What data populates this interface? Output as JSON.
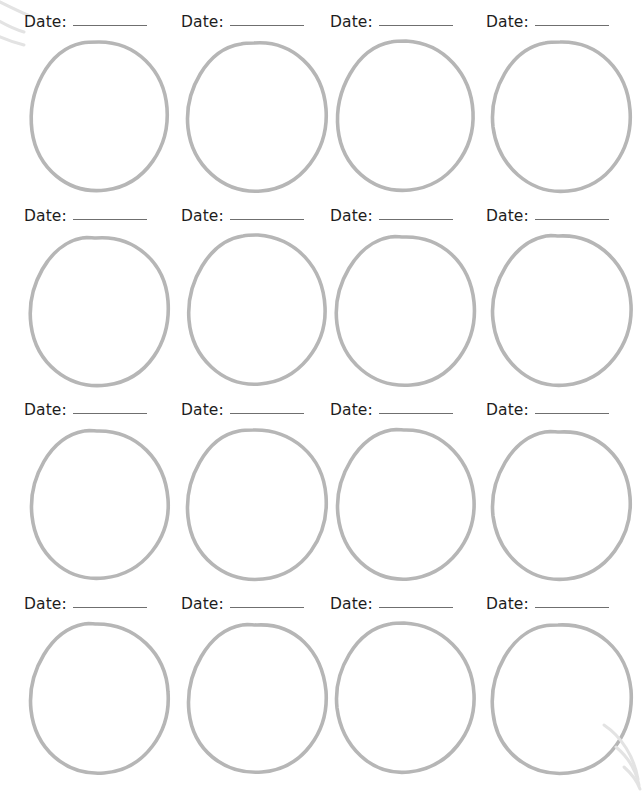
{
  "page": {
    "background_color": "#ffffff",
    "width": 640,
    "height": 789,
    "columns": 4,
    "rows": 4,
    "cell_count": 16
  },
  "style": {
    "label_text_color": "#1d1d1d",
    "rule_line_color": "#6f6f6f",
    "circle_stroke_color": "#b6b6b6",
    "artifact_color": "#e3e3e3"
  },
  "labels": {
    "date_label": "Date:",
    "blank_rule": ""
  },
  "cells": [
    {
      "id": "cell-r1-c1",
      "row": 1,
      "col": 1,
      "date_label": "Date:",
      "date_value": ""
    },
    {
      "id": "cell-r1-c2",
      "row": 1,
      "col": 2,
      "date_label": "Date:",
      "date_value": ""
    },
    {
      "id": "cell-r1-c3",
      "row": 1,
      "col": 3,
      "date_label": "Date:",
      "date_value": ""
    },
    {
      "id": "cell-r1-c4",
      "row": 1,
      "col": 4,
      "date_label": "Date:",
      "date_value": ""
    },
    {
      "id": "cell-r2-c1",
      "row": 2,
      "col": 1,
      "date_label": "Date:",
      "date_value": ""
    },
    {
      "id": "cell-r2-c2",
      "row": 2,
      "col": 2,
      "date_label": "Date:",
      "date_value": ""
    },
    {
      "id": "cell-r2-c3",
      "row": 2,
      "col": 3,
      "date_label": "Date:",
      "date_value": ""
    },
    {
      "id": "cell-r2-c4",
      "row": 2,
      "col": 4,
      "date_label": "Date:",
      "date_value": ""
    },
    {
      "id": "cell-r3-c1",
      "row": 3,
      "col": 1,
      "date_label": "Date:",
      "date_value": ""
    },
    {
      "id": "cell-r3-c2",
      "row": 3,
      "col": 2,
      "date_label": "Date:",
      "date_value": ""
    },
    {
      "id": "cell-r3-c3",
      "row": 3,
      "col": 3,
      "date_label": "Date:",
      "date_value": ""
    },
    {
      "id": "cell-r3-c4",
      "row": 3,
      "col": 4,
      "date_label": "Date:",
      "date_value": ""
    },
    {
      "id": "cell-r4-c1",
      "row": 4,
      "col": 1,
      "date_label": "Date:",
      "date_value": ""
    },
    {
      "id": "cell-r4-c2",
      "row": 4,
      "col": 2,
      "date_label": "Date:",
      "date_value": ""
    },
    {
      "id": "cell-r4-c3",
      "row": 4,
      "col": 3,
      "date_label": "Date:",
      "date_value": ""
    },
    {
      "id": "cell-r4-c4",
      "row": 4,
      "col": 4,
      "date_label": "Date:",
      "date_value": ""
    }
  ],
  "geometry": {
    "column_x": [
      24,
      181,
      330,
      486
    ],
    "row_y": [
      14,
      208,
      402,
      596
    ],
    "cell_width": 150,
    "cell_height": 190,
    "label_offset_x": 6,
    "circle_top_offset": 22
  },
  "circle_paths": [
    "M75,6 C112,6 140,34 143,72 C146,110 122,149 82,154 C44,159 13,132 8,95 C3,56 24,14 58,7 C63,6 70,6 75,6 Z",
    "M73,7 C111,4 142,33 145,73 C148,113 121,152 80,155 C41,158 11,128 7,92 C3,55 26,13 60,8 C64,7 69,7 73,7 Z",
    "M76,5 C114,7 141,38 143,76 C145,114 119,150 80,154 C42,158 12,130 8,93 C4,55 27,12 61,6 C66,5 71,5 76,5 Z",
    "M74,6 C113,5 141,35 144,74 C147,112 123,151 82,155 C43,159 12,129 7,91 C3,54 25,13 59,7 C64,6 69,6 74,6 Z",
    "M72,8 C110,5 141,32 144,71 C147,111 124,150 83,155 C44,160 12,133 7,95 C2,57 25,14 58,8 C62,7 68,8 72,8 Z",
    "M77,5 C115,8 142,37 144,77 C146,115 118,151 79,154 C41,157 11,127 8,90 C5,53 28,11 62,6 C67,5 72,5 77,5 Z",
    "M74,7 C112,6 140,33 144,72 C148,112 122,152 81,155 C42,158 12,131 7,94 C2,56 26,13 60,7 C65,6 69,7 74,7 Z",
    "M73,6 C111,4 143,34 145,75 C147,114 120,151 80,155 C41,159 11,128 7,90 C3,54 27,12 60,6 C65,5 69,6 73,6 Z",
    "M75,7 C113,7 141,36 144,75 C147,113 120,150 80,154 C42,158 12,130 8,92 C4,55 26,13 60,7 C65,6 70,7 75,7 Z",
    "M72,6 C110,5 142,31 145,72 C148,112 123,151 82,155 C43,159 11,132 7,93 C3,56 25,13 58,7 C63,6 68,6 72,6 Z",
    "M76,6 C114,6 142,38 144,76 C146,115 119,151 79,155 C41,158 12,129 8,91 C4,54 28,12 61,6 C66,5 71,6 76,6 Z",
    "M74,8 C112,6 141,34 144,73 C147,112 121,151 81,155 C42,159 12,130 7,92 C3,55 26,14 59,8 C64,7 69,8 74,8 Z",
    "M73,6 C111,6 142,35 144,74 C147,113 121,152 80,155 C41,158 11,130 7,92 C3,54 27,12 60,6 C64,5 69,6 73,6 Z",
    "M76,7 C114,5 141,33 145,73 C148,113 122,151 81,154 C42,157 12,131 8,94 C4,56 27,13 61,7 C66,6 71,7 76,7 Z",
    "M74,5 C112,7 142,36 144,76 C146,114 119,150 79,154 C41,158 12,128 7,90 C3,53 26,12 60,6 C65,5 70,5 74,5 Z",
    "M72,7 C111,5 141,32 145,72 C148,112 124,151 82,155 C43,159 11,133 7,95 C2,57 25,14 58,8 C63,7 68,7 72,7 Z"
  ],
  "artifacts": [
    {
      "id": "artifact-top-left",
      "name": "scan-artifact-top-left",
      "paths": [
        "M2,4 C14,10 26,16 36,20",
        "M0,22 C10,28 20,33 30,36",
        "M4,40 C13,44 22,47 30,49"
      ]
    },
    {
      "id": "artifact-bottom-right",
      "name": "scan-artifact-bottom-right",
      "paths": [
        "M36,6 C54,18 66,38 70,60",
        "M48,28 C60,38 68,52 71,66",
        "M56,48 C64,55 69,62 72,70"
      ]
    }
  ]
}
